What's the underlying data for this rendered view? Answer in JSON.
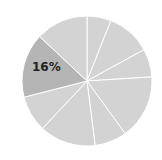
{
  "chart_data": {
    "type": "pie",
    "title": "",
    "start_angle_deg": 0,
    "direction": "clockwise",
    "slices": [
      {
        "value": 6,
        "label": "",
        "color": "#d3d3d3"
      },
      {
        "value": 11,
        "label": "",
        "color": "#d3d3d3"
      },
      {
        "value": 7,
        "label": "",
        "color": "#d3d3d3"
      },
      {
        "value": 16,
        "label": "",
        "color": "#d3d3d3"
      },
      {
        "value": 8,
        "label": "",
        "color": "#d3d3d3"
      },
      {
        "value": 14,
        "label": "",
        "color": "#d3d3d3"
      },
      {
        "value": 9,
        "label": "",
        "color": "#d3d3d3"
      },
      {
        "value": 16,
        "label": "16%",
        "color": "#b5b5b5",
        "highlighted": true
      },
      {
        "value": 13,
        "label": "",
        "color": "#d3d3d3"
      }
    ],
    "values": [
      6,
      11,
      7,
      16,
      8,
      14,
      9,
      16,
      13
    ],
    "visible_labels": [
      "16%"
    ],
    "separator_color": "#ffffff",
    "legend": "none"
  },
  "geometry": {
    "cx": 87,
    "cy": 81,
    "r": 65
  },
  "labels": {
    "highlight": "16%"
  }
}
